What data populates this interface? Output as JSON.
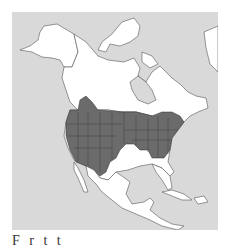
{
  "map": {
    "title": "Range map",
    "region": "North America",
    "colors": {
      "ocean": "#d9d9d9",
      "land": "#ffffff",
      "range": "#6b6b6b",
      "border": "#555555"
    },
    "legend": {
      "range_label": "Breeding / year-round range"
    }
  },
  "caption": {
    "text": "F r           t      t"
  }
}
